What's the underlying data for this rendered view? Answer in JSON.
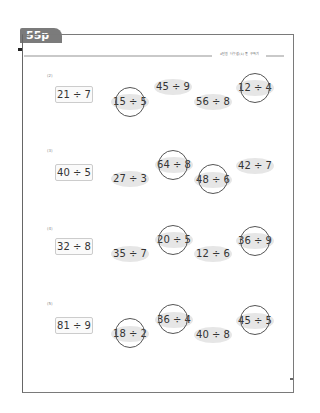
{
  "page": {
    "tab_label": "55p",
    "header_text": "4단원 나눗셈(1) 몫 구하기",
    "page_number_mark": "55"
  },
  "problems": [
    {
      "number": "(2)",
      "question": "21 ÷ 7",
      "options": [
        {
          "text": "15 ÷ 5",
          "circled": true
        },
        {
          "text": "45 ÷ 9",
          "circled": false
        },
        {
          "text": "56 ÷ 8",
          "circled": false
        },
        {
          "text": "12 ÷ 4",
          "circled": true
        }
      ]
    },
    {
      "number": "(3)",
      "question": "40 ÷ 5",
      "options": [
        {
          "text": "27 ÷ 3",
          "circled": false
        },
        {
          "text": "64 ÷ 8",
          "circled": true
        },
        {
          "text": "48 ÷ 6",
          "circled": true
        },
        {
          "text": "42 ÷ 7",
          "circled": false
        }
      ]
    },
    {
      "number": "(4)",
      "question": "32 ÷ 8",
      "options": [
        {
          "text": "35 ÷ 7",
          "circled": false
        },
        {
          "text": "20 ÷ 5",
          "circled": true
        },
        {
          "text": "12 ÷ 6",
          "circled": false
        },
        {
          "text": "36 ÷ 9",
          "circled": true
        }
      ]
    },
    {
      "number": "(5)",
      "question": "81 ÷ 9",
      "options": [
        {
          "text": "18 ÷ 2",
          "circled": true
        },
        {
          "text": "36 ÷ 4",
          "circled": true
        },
        {
          "text": "40 ÷ 8",
          "circled": false
        },
        {
          "text": "45 ÷ 5",
          "circled": true
        }
      ]
    }
  ],
  "colors": {
    "tab": "#7b7b7b",
    "oval_fill": "#e6e6e6",
    "circle_stroke": "#555555",
    "frame": "#7a7a7a"
  }
}
